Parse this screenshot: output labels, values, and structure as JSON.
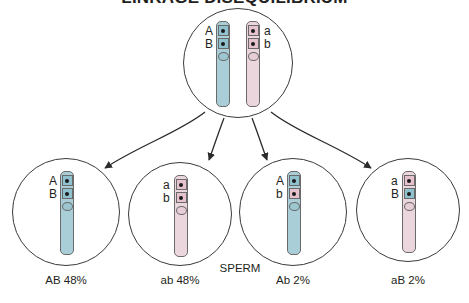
{
  "title": "LINKAGE DISEQUILIBRIUM",
  "sperm_label": "SPERM",
  "colors": {
    "teal": "#a9ced7",
    "pink": "#ecd6de",
    "outline": "#3a3a3a",
    "dot": "#1a1a1a"
  },
  "parent_cell": {
    "name": "parent-germ-cell",
    "chromosomes": [
      {
        "color": "teal",
        "alleles": [
          {
            "label": "A",
            "color": "teal"
          },
          {
            "label": "B",
            "color": "teal"
          }
        ],
        "label_side": "left"
      },
      {
        "color": "pink",
        "alleles": [
          {
            "label": "a",
            "color": "pink"
          },
          {
            "label": "b",
            "color": "pink"
          }
        ],
        "label_side": "right"
      }
    ]
  },
  "gametes": [
    {
      "id": "gamete-ab-parental",
      "caption": "AB 48%",
      "genotype": "AB",
      "frequency": "48%",
      "type": "parental",
      "body_color": "teal",
      "alleles": [
        {
          "label": "A",
          "color": "teal"
        },
        {
          "label": "B",
          "color": "teal"
        }
      ],
      "label_side": "left"
    },
    {
      "id": "gamete-ab-lower-parental",
      "caption": "ab 48%",
      "genotype": "ab",
      "frequency": "48%",
      "type": "parental",
      "body_color": "pink",
      "alleles": [
        {
          "label": "a",
          "color": "pink"
        },
        {
          "label": "b",
          "color": "pink"
        }
      ],
      "label_side": "left"
    },
    {
      "id": "gamete-Ab-recombinant",
      "caption": "Ab 2%",
      "genotype": "Ab",
      "frequency": "2%",
      "type": "recombinant",
      "body_color": "teal",
      "alleles": [
        {
          "label": "A",
          "color": "teal"
        },
        {
          "label": "b",
          "color": "pink"
        }
      ],
      "label_side": "left"
    },
    {
      "id": "gamete-aB-recombinant",
      "caption": "aB 2%",
      "genotype": "aB",
      "frequency": "2%",
      "type": "recombinant",
      "body_color": "pink",
      "alleles": [
        {
          "label": "a",
          "color": "pink"
        },
        {
          "label": "B",
          "color": "teal"
        }
      ],
      "label_side": "left"
    }
  ]
}
